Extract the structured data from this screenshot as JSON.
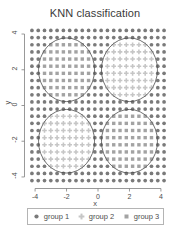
{
  "chart_data": {
    "type": "scatter",
    "title": "KNN classification",
    "xlabel": "x",
    "ylabel": "y",
    "xlim": [
      -4.45,
      4.45
    ],
    "ylim": [
      -4.45,
      4.45
    ],
    "xticks": [
      "-4",
      "-2",
      "0",
      "2",
      "4"
    ],
    "xtick_values": [
      -4,
      -2,
      0,
      2,
      4
    ],
    "yticks": [
      "-4",
      "-2",
      "0",
      "2",
      "4"
    ],
    "ytick_values": [
      -4,
      -2,
      0,
      2,
      4
    ],
    "grid": false,
    "legend_position": "bottom",
    "legend": [
      {
        "name": "group 1",
        "marker": "circle",
        "color": "#7a7a7a"
      },
      {
        "name": "group 2",
        "marker": "plus",
        "color": "#c6c6c6"
      },
      {
        "name": "group 3",
        "marker": "square",
        "color": "#a3a3a3"
      }
    ],
    "grid_spec": {
      "x_start": -4.2,
      "x_end": 4.2,
      "y_start": -4.2,
      "y_end": 4.2,
      "step": 0.4,
      "description": "Regular lattice of prediction points covering the plane"
    },
    "decision_regions": [
      {
        "group": "group 3",
        "center": [
          -2,
          2
        ],
        "radius": 1.78,
        "marker": "square",
        "color": "#a3a3a3"
      },
      {
        "group": "group 2",
        "center": [
          2,
          2
        ],
        "radius": 1.78,
        "marker": "plus",
        "color": "#c6c6c6"
      },
      {
        "group": "group 2",
        "center": [
          -2,
          -2
        ],
        "radius": 1.78,
        "marker": "plus",
        "color": "#c6c6c6"
      },
      {
        "group": "group 3",
        "center": [
          2,
          -2
        ],
        "radius": 1.78,
        "marker": "square",
        "color": "#a3a3a3"
      }
    ],
    "background_group": "group 1",
    "boundary_circles": [
      {
        "center": [
          -2,
          2
        ],
        "radius": 1.78
      },
      {
        "center": [
          2,
          2
        ],
        "radius": 1.78
      },
      {
        "center": [
          -2,
          -2
        ],
        "radius": 1.78
      },
      {
        "center": [
          2,
          -2
        ],
        "radius": 1.78
      }
    ],
    "colors": {
      "group1": "#7a7a7a",
      "group2": "#c6c6c6",
      "group3": "#a3a3a3",
      "boundary": "#4d4d4d",
      "axis": "#7f7f7f",
      "text": "#4d4d4d",
      "background": "#ffffff"
    }
  }
}
